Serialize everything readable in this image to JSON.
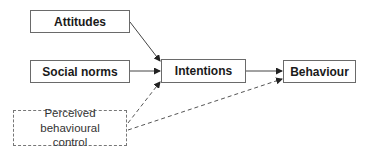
{
  "diagram": {
    "nodes": [
      {
        "id": "attitudes",
        "label": "Attitudes",
        "style": "solid"
      },
      {
        "id": "social_norms",
        "label": "Social norms",
        "style": "solid"
      },
      {
        "id": "intentions",
        "label": "Intentions",
        "style": "solid"
      },
      {
        "id": "behaviour",
        "label": "Behaviour",
        "style": "solid"
      },
      {
        "id": "pbc",
        "label": "Perceived behavioural control",
        "style": "dashed"
      }
    ],
    "edges": [
      {
        "from": "attitudes",
        "to": "intentions",
        "style": "solid"
      },
      {
        "from": "social_norms",
        "to": "intentions",
        "style": "solid"
      },
      {
        "from": "pbc",
        "to": "intentions",
        "style": "dashed"
      },
      {
        "from": "intentions",
        "to": "behaviour",
        "style": "solid"
      },
      {
        "from": "pbc",
        "to": "behaviour",
        "style": "dashed"
      }
    ],
    "labels": {
      "attitudes": "Attitudes",
      "social_norms": "Social norms",
      "intentions": "Intentions",
      "behaviour": "Behaviour",
      "pbc_line1": "Perceived behavioural",
      "pbc_line2": "control"
    }
  }
}
